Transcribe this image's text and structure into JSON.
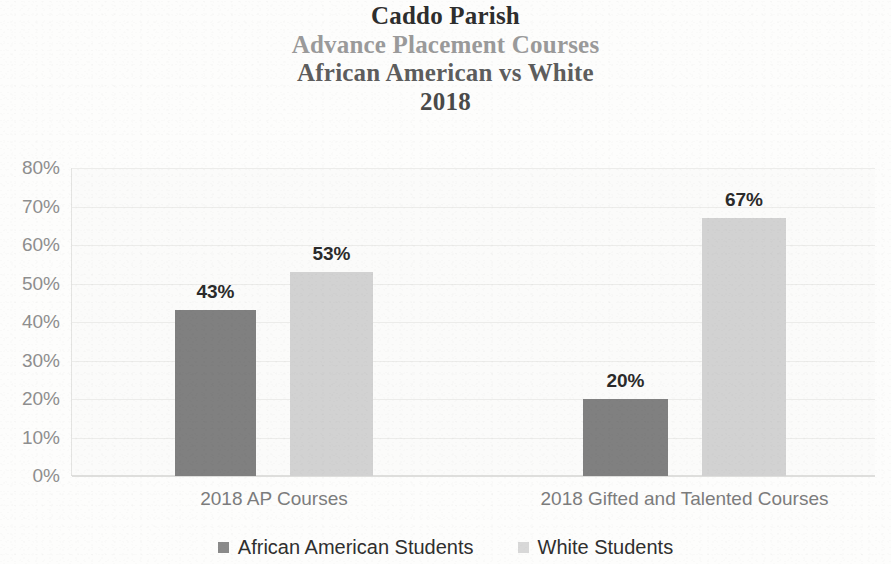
{
  "title": {
    "line1": "Caddo Parish",
    "line2": "Advance Placement Courses",
    "line3": "African American vs White",
    "line4": "2018"
  },
  "chart_data": {
    "type": "bar",
    "title": "Caddo Parish Advance Placement Courses African American vs White 2018",
    "subtitle": "",
    "xlabel": "",
    "ylabel": "",
    "categories": [
      "2018 AP Courses",
      "2018 Gifted and Talented Courses"
    ],
    "series": [
      {
        "name": "African American Students",
        "color": "#808080",
        "values": [
          43,
          53
        ],
        "value_labels": [
          "43%",
          "20%"
        ]
      },
      {
        "name": "White Students",
        "color": "#d2d2d2",
        "values": [
          53,
          67
        ],
        "value_labels": [
          "53%",
          "67%"
        ]
      }
    ],
    "bars": [
      {
        "category": "2018 AP Courses",
        "series": "African American Students",
        "value": 43,
        "label": "43%"
      },
      {
        "category": "2018 AP Courses",
        "series": "White Students",
        "value": 53,
        "label": "53%"
      },
      {
        "category": "2018 Gifted and Talented Courses",
        "series": "African American Students",
        "value": 20,
        "label": "20%"
      },
      {
        "category": "2018 Gifted and Talented Courses",
        "series": "White Students",
        "value": 67,
        "label": "67%"
      }
    ],
    "ylim": [
      0,
      80
    ],
    "ytick_step": 10,
    "ytick_labels": [
      "80%",
      "70%",
      "60%",
      "50%",
      "40%",
      "30%",
      "20%",
      "10%",
      "0%"
    ],
    "ytick_values": [
      80,
      70,
      60,
      50,
      40,
      30,
      20,
      10,
      0
    ],
    "grid": true,
    "grid_axis": "y",
    "legend_position": "bottom",
    "units": "percent"
  },
  "legend": {
    "items": [
      {
        "label": "African American Students",
        "swatch": "series-aa"
      },
      {
        "label": "White Students",
        "swatch": "series-wh"
      }
    ]
  }
}
